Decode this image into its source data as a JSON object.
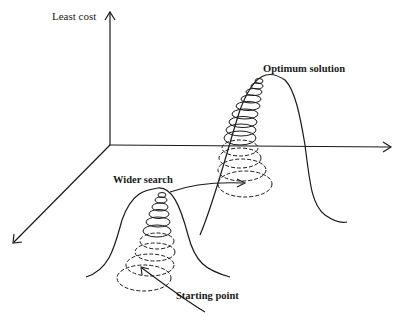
{
  "diagram": {
    "type": "3d-cost-surface-search",
    "labels": {
      "y_axis": "Least cost",
      "optimum": "Optimum solution",
      "wider_search": "Wider search",
      "start": "Starting point"
    },
    "axes": [
      "vertical (least cost)",
      "horizontal (right)",
      "depth (lower-left)"
    ],
    "peaks": [
      {
        "name": "local-peak",
        "description": "smaller peak with spiral search from starting point"
      },
      {
        "name": "global-peak",
        "description": "taller peak reached via wider search, spiral climbs to optimum solution"
      }
    ],
    "colors": {
      "stroke": "#1a1a1a",
      "background": "#ffffff"
    }
  }
}
